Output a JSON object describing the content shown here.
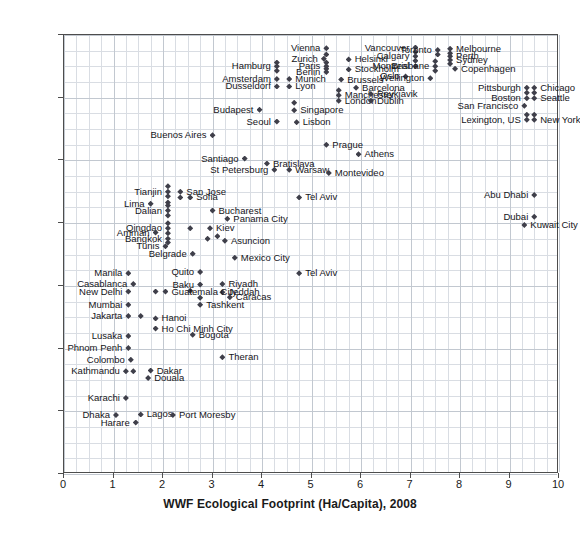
{
  "chart_data": {
    "type": "scatter",
    "title": "",
    "xlabel": "WWF Ecological Footprint (Ha/Capita), 2008",
    "ylabel": "EIU Liveability index 2009",
    "xlim": [
      0,
      10
    ],
    "ylim": [
      30,
      100
    ],
    "xticks": [
      "0",
      "1",
      "2",
      "3",
      "4",
      "5",
      "6",
      "7",
      "8",
      "9",
      "10"
    ],
    "yticks": [
      "30",
      "40",
      "50",
      "60",
      "70",
      "80",
      "90",
      "100"
    ],
    "grid": true,
    "legend": "none",
    "marker": "diamond",
    "marker_color": "#3f3f4a",
    "points": [
      {
        "label": "Vienna",
        "x": 5.3,
        "y": 97.9,
        "side": "ll"
      },
      {
        "label": "Zurich",
        "x": 5.25,
        "y": 96.2,
        "side": "ll"
      },
      {
        "label": "Paris",
        "x": 5.3,
        "y": 95.0,
        "side": "ll"
      },
      {
        "label": "Berlin",
        "x": 5.3,
        "y": 94.1,
        "side": "ll"
      },
      {
        "label": "Helsinki",
        "x": 5.75,
        "y": 96.1,
        "side": "lr"
      },
      {
        "label": "Stockholm",
        "x": 5.75,
        "y": 94.5,
        "side": "lr"
      },
      {
        "label": "Hamburg",
        "x": 4.3,
        "y": 95.0,
        "side": "ll"
      },
      {
        "label": "Amsterdam",
        "x": 4.3,
        "y": 93.0,
        "side": "ll"
      },
      {
        "label": "Dusseldorf",
        "x": 4.3,
        "y": 91.8,
        "side": "ll"
      },
      {
        "label": "Munich",
        "x": 4.55,
        "y": 93.0,
        "side": "lr"
      },
      {
        "label": "Lyon",
        "x": 4.55,
        "y": 91.8,
        "side": "lr"
      },
      {
        "label": "Brussels",
        "x": 5.6,
        "y": 92.9,
        "side": "lr"
      },
      {
        "label": "Barcelona",
        "x": 5.9,
        "y": 91.6,
        "side": "lr"
      },
      {
        "label": "Manchester",
        "x": 5.55,
        "y": 90.4,
        "side": "lr"
      },
      {
        "label": "London",
        "x": 5.55,
        "y": 89.5,
        "side": "lr"
      },
      {
        "label": "Reykjavik",
        "x": 6.2,
        "y": 90.6,
        "side": "lr"
      },
      {
        "label": "Dublin",
        "x": 6.2,
        "y": 89.5,
        "side": "lr"
      },
      {
        "label": "Vancouver",
        "x": 7.1,
        "y": 98.0,
        "side": "ll"
      },
      {
        "label": "Calgary",
        "x": 7.1,
        "y": 96.6,
        "side": "ll"
      },
      {
        "label": "Montreal",
        "x": 7.1,
        "y": 95.0,
        "side": "ll"
      },
      {
        "label": "Oslo",
        "x": 6.9,
        "y": 93.4,
        "side": "ll"
      },
      {
        "label": "Toronto",
        "x": 7.55,
        "y": 97.6,
        "side": "ll"
      },
      {
        "label": "Brisbane",
        "x": 7.5,
        "y": 95.0,
        "side": "ll"
      },
      {
        "label": "Melbourne",
        "x": 7.8,
        "y": 97.8,
        "side": "lr"
      },
      {
        "label": "Perth",
        "x": 7.8,
        "y": 96.6,
        "side": "lr"
      },
      {
        "label": "Sydney",
        "x": 7.8,
        "y": 96.0,
        "side": "lr"
      },
      {
        "label": "Copenhagen",
        "x": 7.9,
        "y": 94.6,
        "side": "lr"
      },
      {
        "label": "Wellington",
        "x": 7.4,
        "y": 93.1,
        "side": "ll"
      },
      {
        "label": "Pittsburgh",
        "x": 9.35,
        "y": 91.6,
        "side": "ll"
      },
      {
        "label": "Boston",
        "x": 9.35,
        "y": 89.9,
        "side": "ll"
      },
      {
        "label": "San Francisco",
        "x": 9.3,
        "y": 88.7,
        "side": "ll"
      },
      {
        "label": "Chicago",
        "x": 9.5,
        "y": 91.6,
        "side": "lr"
      },
      {
        "label": "Seattle",
        "x": 9.5,
        "y": 89.9,
        "side": "lr"
      },
      {
        "label": "New York",
        "x": 9.5,
        "y": 86.5,
        "side": "lr"
      },
      {
        "label": "Lexington, US",
        "x": 9.35,
        "y": 86.5,
        "side": "ll"
      },
      {
        "label": "Budapest",
        "x": 3.95,
        "y": 88.1,
        "side": "ll"
      },
      {
        "label": "Singapore",
        "x": 4.65,
        "y": 88.0,
        "side": "lr"
      },
      {
        "label": "Seoul",
        "x": 4.3,
        "y": 86.2,
        "side": "ll"
      },
      {
        "label": "Lisbon",
        "x": 4.7,
        "y": 86.1,
        "side": "lr"
      },
      {
        "label": "Buenos Aires",
        "x": 3.0,
        "y": 84.0,
        "side": "ll"
      },
      {
        "label": "Prague",
        "x": 5.3,
        "y": 82.5,
        "side": "lr"
      },
      {
        "label": "Athens",
        "x": 5.95,
        "y": 81.0,
        "side": "lr"
      },
      {
        "label": "Santiago",
        "x": 3.65,
        "y": 80.3,
        "side": "ll"
      },
      {
        "label": "Bratislava",
        "x": 4.1,
        "y": 79.5,
        "side": "lr"
      },
      {
        "label": "St Petersburg",
        "x": 4.25,
        "y": 78.5,
        "side": "ll"
      },
      {
        "label": "Warsaw",
        "x": 4.55,
        "y": 78.5,
        "side": "lr"
      },
      {
        "label": "Montevideo",
        "x": 5.35,
        "y": 78.0,
        "side": "lr"
      },
      {
        "label": "Tianjin",
        "x": 2.1,
        "y": 75.0,
        "side": "ll"
      },
      {
        "label": "San Jose",
        "x": 2.35,
        "y": 75.0,
        "side": "lr"
      },
      {
        "label": "Sofia",
        "x": 2.55,
        "y": 74.1,
        "side": "lr"
      },
      {
        "label": "Abu Dhabi",
        "x": 9.5,
        "y": 74.5,
        "side": "ll"
      },
      {
        "label": "Lima",
        "x": 1.75,
        "y": 73.1,
        "side": "ll"
      },
      {
        "label": "Dalian",
        "x": 2.1,
        "y": 72.0,
        "side": "ll"
      },
      {
        "label": "Bucharest",
        "x": 3.0,
        "y": 72.0,
        "side": "lr"
      },
      {
        "label": "Panama City",
        "x": 3.3,
        "y": 70.7,
        "side": "lr"
      },
      {
        "label": "Tel Aviv",
        "x": 4.75,
        "y": 74.1,
        "side": "lr"
      },
      {
        "label": "Dubai",
        "x": 9.5,
        "y": 71.0,
        "side": "ll"
      },
      {
        "label": "Kuwait City",
        "x": 9.3,
        "y": 69.7,
        "side": "lr"
      },
      {
        "label": "Qingdao",
        "x": 2.1,
        "y": 69.2,
        "side": "ll"
      },
      {
        "label": "Kiev",
        "x": 2.95,
        "y": 69.2,
        "side": "lr"
      },
      {
        "label": "Amman",
        "x": 1.85,
        "y": 68.5,
        "side": "ll"
      },
      {
        "label": "Bangkok",
        "x": 2.1,
        "y": 67.5,
        "side": "ll"
      },
      {
        "label": "Asuncion",
        "x": 3.25,
        "y": 67.2,
        "side": "lr"
      },
      {
        "label": "Tunis",
        "x": 2.05,
        "y": 66.3,
        "side": "ll"
      },
      {
        "label": "Belgrade",
        "x": 2.6,
        "y": 65.1,
        "side": "ll"
      },
      {
        "label": "Mexico City",
        "x": 3.45,
        "y": 64.5,
        "side": "lr"
      },
      {
        "label": "Quito",
        "x": 2.75,
        "y": 62.2,
        "side": "ll"
      },
      {
        "label": "Manila",
        "x": 1.3,
        "y": 62.0,
        "side": "ll"
      },
      {
        "label": "Tel Aviv",
        "x": 4.75,
        "y": 62.0,
        "side": "lr"
      },
      {
        "label": "Casablanca",
        "x": 1.4,
        "y": 60.3,
        "side": "ll"
      },
      {
        "label": "Baku",
        "x": 2.75,
        "y": 60.2,
        "side": "ll"
      },
      {
        "label": "Riyadh",
        "x": 3.2,
        "y": 60.3,
        "side": "lr"
      },
      {
        "label": "New Delhi",
        "x": 1.3,
        "y": 59.1,
        "side": "ll"
      },
      {
        "label": "Jeddah",
        "x": 3.2,
        "y": 59.0,
        "side": "lr"
      },
      {
        "label": "Caracas",
        "x": 3.35,
        "y": 58.2,
        "side": "lr"
      },
      {
        "label": "Guatemala City",
        "x": 2.05,
        "y": 59.1,
        "side": "lr"
      },
      {
        "label": "Mumbai",
        "x": 1.3,
        "y": 57.0,
        "side": "ll"
      },
      {
        "label": "Tashkent",
        "x": 2.75,
        "y": 57.0,
        "side": "lr"
      },
      {
        "label": "Jakarta",
        "x": 1.3,
        "y": 55.2,
        "side": "ll"
      },
      {
        "label": "Hanoi",
        "x": 1.85,
        "y": 54.8,
        "side": "lr"
      },
      {
        "label": "Ho Chi Minh City",
        "x": 1.85,
        "y": 53.2,
        "side": "lr"
      },
      {
        "label": "Bogota",
        "x": 2.6,
        "y": 52.2,
        "side": "lr"
      },
      {
        "label": "Lusaka",
        "x": 1.3,
        "y": 52.0,
        "side": "ll"
      },
      {
        "label": "Phnom Penh",
        "x": 1.3,
        "y": 50.1,
        "side": "ll"
      },
      {
        "label": "Theran",
        "x": 3.2,
        "y": 48.6,
        "side": "lr"
      },
      {
        "label": "Colombo",
        "x": 1.35,
        "y": 48.2,
        "side": "ll"
      },
      {
        "label": "Kathmandu",
        "x": 1.25,
        "y": 46.4,
        "side": "ll"
      },
      {
        "label": "Dakar",
        "x": 1.75,
        "y": 46.5,
        "side": "lr"
      },
      {
        "label": "Douala",
        "x": 1.7,
        "y": 45.3,
        "side": "lr"
      },
      {
        "label": "Karachi",
        "x": 1.25,
        "y": 42.1,
        "side": "ll"
      },
      {
        "label": "Dhaka",
        "x": 1.05,
        "y": 39.4,
        "side": "ll"
      },
      {
        "label": "Lagos",
        "x": 1.55,
        "y": 39.5,
        "side": "lr"
      },
      {
        "label": "Port Moresby",
        "x": 2.2,
        "y": 39.4,
        "side": "lr"
      },
      {
        "label": "Harare",
        "x": 1.45,
        "y": 38.2,
        "side": "ll"
      }
    ],
    "extra_markers": [
      {
        "x": 5.3,
        "y": 96.9
      },
      {
        "x": 5.3,
        "y": 95.6
      },
      {
        "x": 5.3,
        "y": 94.6
      },
      {
        "x": 4.3,
        "y": 95.6
      },
      {
        "x": 4.3,
        "y": 94.3
      },
      {
        "x": 4.65,
        "y": 89.2
      },
      {
        "x": 5.55,
        "y": 91.2
      },
      {
        "x": 7.1,
        "y": 97.3
      },
      {
        "x": 7.1,
        "y": 95.9
      },
      {
        "x": 7.55,
        "y": 96.9
      },
      {
        "x": 7.5,
        "y": 95.8
      },
      {
        "x": 7.5,
        "y": 94.3
      },
      {
        "x": 7.8,
        "y": 97.1
      },
      {
        "x": 7.8,
        "y": 95.4
      },
      {
        "x": 9.35,
        "y": 90.8
      },
      {
        "x": 9.5,
        "y": 90.8
      },
      {
        "x": 9.5,
        "y": 87.3
      },
      {
        "x": 9.35,
        "y": 87.3
      },
      {
        "x": 2.1,
        "y": 75.9
      },
      {
        "x": 2.1,
        "y": 74.3
      },
      {
        "x": 2.1,
        "y": 73.3
      },
      {
        "x": 2.1,
        "y": 72.8
      },
      {
        "x": 2.1,
        "y": 71.2
      },
      {
        "x": 2.1,
        "y": 70.0
      },
      {
        "x": 2.1,
        "y": 68.4
      },
      {
        "x": 2.1,
        "y": 66.9
      },
      {
        "x": 2.35,
        "y": 74.1
      },
      {
        "x": 2.55,
        "y": 69.2
      },
      {
        "x": 2.9,
        "y": 67.5
      },
      {
        "x": 3.1,
        "y": 67.9
      },
      {
        "x": 1.85,
        "y": 59.1
      },
      {
        "x": 2.55,
        "y": 59.2
      },
      {
        "x": 2.75,
        "y": 58.1
      },
      {
        "x": 1.55,
        "y": 55.2
      },
      {
        "x": 1.4,
        "y": 46.4
      }
    ]
  }
}
